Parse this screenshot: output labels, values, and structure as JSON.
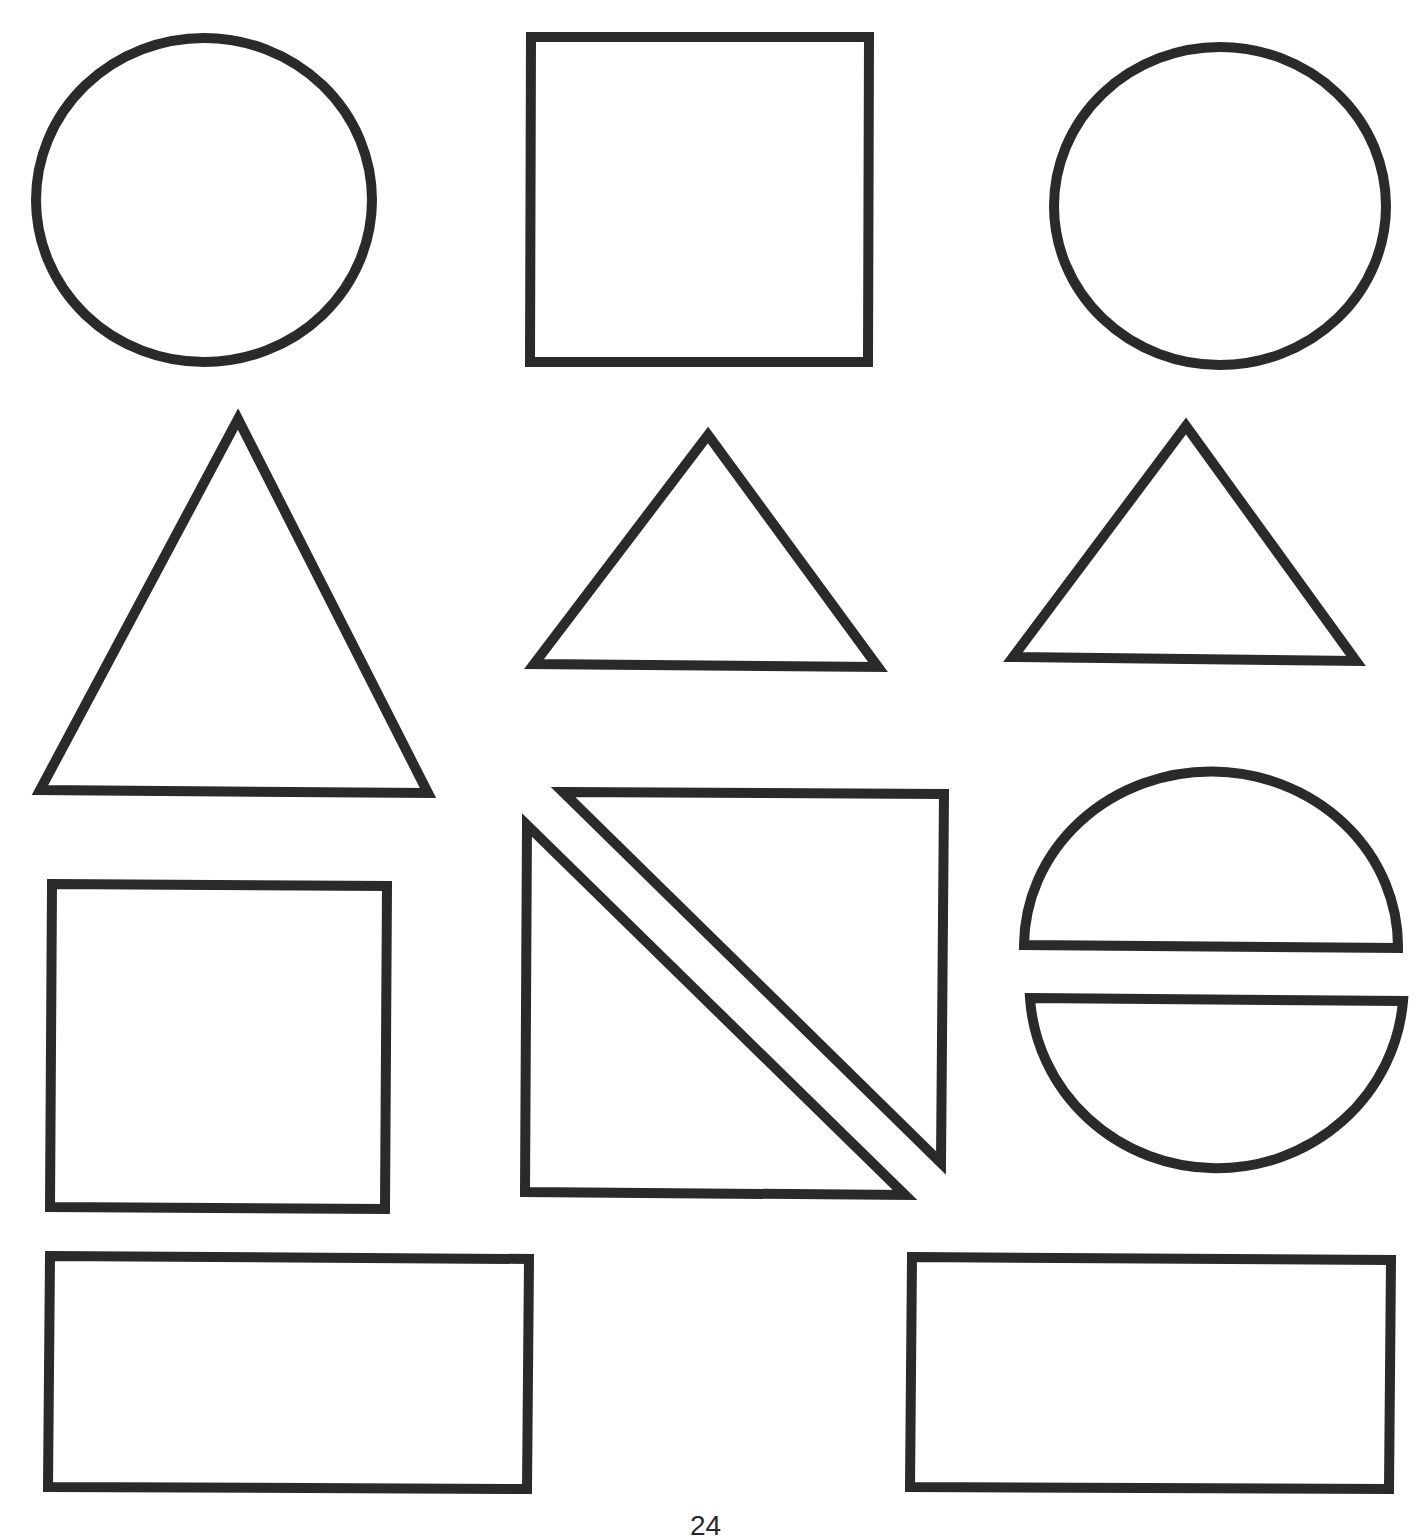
{
  "page": {
    "background": "#ffffff",
    "stroke_color": "#2a2a2a",
    "stroke_width": 10,
    "page_number": "24"
  },
  "shapes": [
    {
      "name": "circle-top-left",
      "type": "ellipse",
      "cx": 204,
      "cy": 200,
      "rx": 168,
      "ry": 162
    },
    {
      "name": "square-top-middle",
      "type": "polygon",
      "points": "531,37 869,37 868,362 530,362"
    },
    {
      "name": "circle-top-right",
      "type": "ellipse",
      "cx": 1220,
      "cy": 206,
      "rx": 166,
      "ry": 159
    },
    {
      "name": "triangle-large-left",
      "type": "polygon",
      "points": "238,419 428,793 40,790"
    },
    {
      "name": "triangle-middle",
      "type": "polygon",
      "points": "708,435 878,667 534,664"
    },
    {
      "name": "triangle-right",
      "type": "polygon",
      "points": "1186,426 1356,661 1013,657"
    },
    {
      "name": "square-middle-left",
      "type": "polygon",
      "points": "52,884 387,886 385,1209 50,1207"
    },
    {
      "name": "triangle-split-upper",
      "type": "polygon",
      "points": "563,792 944,794 941,1163"
    },
    {
      "name": "triangle-split-lower",
      "type": "polygon",
      "points": "527,825 905,1195 525,1192"
    },
    {
      "name": "semicircle-top",
      "type": "path",
      "d": "M1024,945 A187,175 0 0 1 1398,948 Z"
    },
    {
      "name": "semicircle-bottom",
      "type": "path",
      "d": "M1030,998 L1403,1001 A187,182 0 0 1 1030,998 Z"
    },
    {
      "name": "rectangle-bottom-left",
      "type": "polygon",
      "points": "50,1256 529,1259 527,1489 48,1487"
    },
    {
      "name": "rectangle-bottom-right",
      "type": "polygon",
      "points": "912,1257 1391,1260 1389,1489 910,1487"
    }
  ]
}
